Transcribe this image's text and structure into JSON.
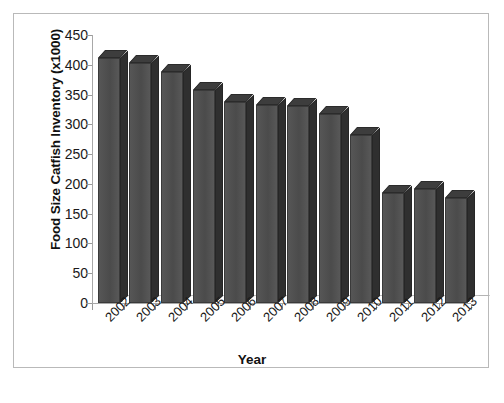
{
  "chart_data": {
    "type": "bar",
    "title": "",
    "xlabel": "Year",
    "ylabel": "Food Size Catfish Inventory (x1000)",
    "categories": [
      "2002",
      "2003",
      "2004",
      "2005",
      "2006",
      "2007",
      "2008",
      "2009",
      "2010",
      "2011",
      "2012",
      "2013"
    ],
    "values": [
      412,
      403,
      388,
      357,
      337,
      332,
      331,
      317,
      282,
      185,
      192,
      177
    ],
    "ylim": [
      0,
      450
    ],
    "yticks": [
      0,
      50,
      100,
      150,
      200,
      250,
      300,
      350,
      400,
      450
    ],
    "ytick_labels": [
      "0",
      "50",
      "100",
      "150",
      "200",
      "250",
      "300",
      "350",
      "400",
      "450"
    ],
    "grid": false,
    "legend": false,
    "style": "3d-column",
    "bar_color": "#4f4f4f",
    "bar_side_color": "#2f2f2f",
    "bar_top_color": "#3d3d3d",
    "axis_color": "#a8a8a8",
    "border_color": "#b9b9b9",
    "background": "#ffffff"
  }
}
